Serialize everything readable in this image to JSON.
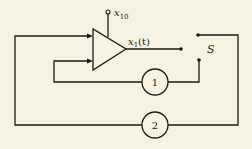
{
  "diagram": {
    "type": "circuit-block-diagram",
    "amplifier": {
      "input_label_main": "x",
      "input_label_sub": "10",
      "output_label_main": "x",
      "output_label_sub": "1",
      "output_label_arg": "(t)"
    },
    "switch": {
      "label": "S"
    },
    "blocks": [
      {
        "id": "block-1",
        "label": "1"
      },
      {
        "id": "block-2",
        "label": "2"
      }
    ],
    "colors": {
      "background": "#f7f3e3",
      "ink": "#1c1a17"
    }
  }
}
